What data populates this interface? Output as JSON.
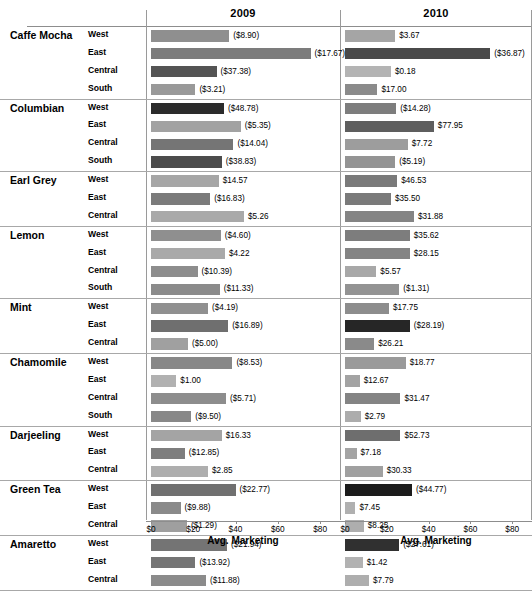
{
  "header": {
    "columns": [
      "2009",
      "2010"
    ]
  },
  "axis": {
    "title": "Avg. Marketing",
    "ticks": [
      "$0",
      "$20",
      "$40",
      "$60",
      "$80"
    ],
    "tick_values": [
      0,
      20,
      40,
      60,
      80
    ],
    "min": 0,
    "max": 88
  },
  "columns": {
    "category_header": "",
    "region_header": ""
  },
  "chart_data": {
    "type": "bar",
    "title": "",
    "subtitle": "",
    "xlabel": "Avg. Marketing",
    "ylabel": "",
    "xlim": [
      0,
      88
    ],
    "grid": false,
    "legend": "none",
    "orientation": "horizontal",
    "panel_columns": [
      "2009",
      "2010"
    ],
    "bar_length_measure": "Avg. Marketing",
    "bar_label_measure": "Profit",
    "note": "Bar length encodes Avg. Marketing; text label shows Profit (parentheses = negative). Bar darkness encodes profit magnitude.",
    "groups": [
      {
        "category": "Caffe Mocha",
        "rows": [
          {
            "region": "West",
            "y2009": {
              "marketing": 37.0,
              "label": "($8.90)",
              "shade": "#8f8f8f"
            },
            "y2010": {
              "marketing": 24.0,
              "label": "$3.67",
              "shade": "#a5a5a5"
            }
          },
          {
            "region": "East",
            "y2009": {
              "marketing": 75.5,
              "label": "($17.67)",
              "shade": "#7c7c7c"
            },
            "y2010": {
              "marketing": 69.5,
              "label": "($36.87)",
              "shade": "#4a4a4a"
            }
          },
          {
            "region": "Central",
            "y2009": {
              "marketing": 31.0,
              "label": "($37.38)",
              "shade": "#545454"
            },
            "y2010": {
              "marketing": 22.0,
              "label": "$0.18",
              "shade": "#b4b4b4"
            }
          },
          {
            "region": "South",
            "y2009": {
              "marketing": 21.0,
              "label": "($3.21)",
              "shade": "#999999"
            },
            "y2010": {
              "marketing": 15.5,
              "label": "$17.00",
              "shade": "#8b8b8b"
            }
          }
        ]
      },
      {
        "category": "Columbian",
        "rows": [
          {
            "region": "West",
            "y2009": {
              "marketing": 34.5,
              "label": "($48.78)",
              "shade": "#2b2b2b"
            },
            "y2010": {
              "marketing": 24.5,
              "label": "($14.28)",
              "shade": "#7d7d7d"
            }
          },
          {
            "region": "East",
            "y2009": {
              "marketing": 42.5,
              "label": "($5.35)",
              "shade": "#a2a2a2"
            },
            "y2010": {
              "marketing": 42.5,
              "label": "$77.95",
              "shade": "#5e5e5e"
            }
          },
          {
            "region": "Central",
            "y2009": {
              "marketing": 39.0,
              "label": "($14.04)",
              "shade": "#757575"
            },
            "y2010": {
              "marketing": 30.0,
              "label": "$7.72",
              "shade": "#9d9d9d"
            }
          },
          {
            "region": "South",
            "y2009": {
              "marketing": 33.5,
              "label": "($38.83)",
              "shade": "#4c4c4c"
            },
            "y2010": {
              "marketing": 24.0,
              "label": "($5.19)",
              "shade": "#949494"
            }
          }
        ]
      },
      {
        "category": "Earl Grey",
        "rows": [
          {
            "region": "West",
            "y2009": {
              "marketing": 32.0,
              "label": "$14.57",
              "shade": "#a6a6a6"
            },
            "y2010": {
              "marketing": 25.0,
              "label": "$46.53",
              "shade": "#7a7a7a"
            }
          },
          {
            "region": "East",
            "y2009": {
              "marketing": 28.0,
              "label": "($16.83)",
              "shade": "#7b7b7b"
            },
            "y2010": {
              "marketing": 22.0,
              "label": "$35.50",
              "shade": "#7a7a7a"
            }
          },
          {
            "region": "Central",
            "y2009": {
              "marketing": 44.0,
              "label": "$5.26",
              "shade": "#a9a9a9"
            },
            "y2010": {
              "marketing": 33.0,
              "label": "$31.88",
              "shade": "#848484"
            }
          }
        ]
      },
      {
        "category": "Lemon",
        "rows": [
          {
            "region": "West",
            "y2009": {
              "marketing": 33.0,
              "label": "($4.60)",
              "shade": "#8f8f8f"
            },
            "y2010": {
              "marketing": 31.0,
              "label": "$35.62",
              "shade": "#7d7d7d"
            }
          },
          {
            "region": "East",
            "y2009": {
              "marketing": 35.0,
              "label": "$4.22",
              "shade": "#a9a9a9"
            },
            "y2010": {
              "marketing": 31.0,
              "label": "$28.15",
              "shade": "#848484"
            }
          },
          {
            "region": "Central",
            "y2009": {
              "marketing": 22.0,
              "label": "($10.39)",
              "shade": "#8d8d8d"
            },
            "y2010": {
              "marketing": 15.0,
              "label": "$5.57",
              "shade": "#a8a8a8"
            }
          },
          {
            "region": "South",
            "y2009": {
              "marketing": 32.5,
              "label": "($11.33)",
              "shade": "#8b8b8b"
            },
            "y2010": {
              "marketing": 26.0,
              "label": "($1.31)",
              "shade": "#939393"
            }
          }
        ]
      },
      {
        "category": "Mint",
        "rows": [
          {
            "region": "West",
            "y2009": {
              "marketing": 27.0,
              "label": "($4.19)",
              "shade": "#909090"
            },
            "y2010": {
              "marketing": 21.0,
              "label": "$17.75",
              "shade": "#8d8d8d"
            }
          },
          {
            "region": "East",
            "y2009": {
              "marketing": 36.5,
              "label": "($16.89)",
              "shade": "#6f6f6f"
            },
            "y2010": {
              "marketing": 31.0,
              "label": "($28.19)",
              "shade": "#262626"
            }
          },
          {
            "region": "Central",
            "y2009": {
              "marketing": 17.5,
              "label": "($5.00)",
              "shade": "#a0a0a0"
            },
            "y2010": {
              "marketing": 14.0,
              "label": "$26.21",
              "shade": "#8a8a8a"
            }
          }
        ]
      },
      {
        "category": "Chamomile",
        "rows": [
          {
            "region": "West",
            "y2009": {
              "marketing": 38.5,
              "label": "($8.53)",
              "shade": "#888888"
            },
            "y2010": {
              "marketing": 29.0,
              "label": "$18.77",
              "shade": "#9a9a9a"
            }
          },
          {
            "region": "East",
            "y2009": {
              "marketing": 12.0,
              "label": "$1.00",
              "shade": "#b1b1b1"
            },
            "y2010": {
              "marketing": 7.0,
              "label": "$12.67",
              "shade": "#a3a3a3"
            }
          },
          {
            "region": "Central",
            "y2009": {
              "marketing": 35.5,
              "label": "($5.71)",
              "shade": "#8d8d8d"
            },
            "y2010": {
              "marketing": 26.5,
              "label": "$31.47",
              "shade": "#848484"
            }
          },
          {
            "region": "South",
            "y2009": {
              "marketing": 19.0,
              "label": "($9.50)",
              "shade": "#888888"
            },
            "y2010": {
              "marketing": 7.5,
              "label": "$2.79",
              "shade": "#acacac"
            }
          }
        ]
      },
      {
        "category": "Darjeeling",
        "rows": [
          {
            "region": "West",
            "y2009": {
              "marketing": 33.5,
              "label": "$16.33",
              "shade": "#a4a4a4"
            },
            "y2010": {
              "marketing": 26.5,
              "label": "$52.73",
              "shade": "#6e6e6e"
            }
          },
          {
            "region": "East",
            "y2009": {
              "marketing": 16.0,
              "label": "($12.85)",
              "shade": "#7e7e7e"
            },
            "y2010": {
              "marketing": 5.5,
              "label": "$7.18",
              "shade": "#a4a4a4"
            }
          },
          {
            "region": "Central",
            "y2009": {
              "marketing": 27.0,
              "label": "$2.85",
              "shade": "#aeaeae"
            },
            "y2010": {
              "marketing": 18.0,
              "label": "$30.33",
              "shade": "#a0a0a0"
            }
          }
        ]
      },
      {
        "category": "Green Tea",
        "rows": [
          {
            "region": "West",
            "y2009": {
              "marketing": 40.0,
              "label": "($22.77)",
              "shade": "#707070"
            },
            "y2010": {
              "marketing": 32.0,
              "label": "($44.77)",
              "shade": "#1c1c1c"
            }
          },
          {
            "region": "East",
            "y2009": {
              "marketing": 14.0,
              "label": "($9.88)",
              "shade": "#8a8a8a"
            },
            "y2010": {
              "marketing": 5.0,
              "label": "$7.45",
              "shade": "#b0b0b0"
            }
          },
          {
            "region": "Central",
            "y2009": {
              "marketing": 17.0,
              "label": "($1.29)",
              "shade": "#9f9f9f"
            },
            "y2010": {
              "marketing": 9.0,
              "label": "$8.25",
              "shade": "#aeaeae"
            }
          }
        ]
      },
      {
        "category": "Amaretto",
        "rows": [
          {
            "region": "West",
            "y2009": {
              "marketing": 36.0,
              "label": "($21.94)",
              "shade": "#747474"
            },
            "y2010": {
              "marketing": 26.0,
              "label": "($27.61)",
              "shade": "#303030"
            }
          },
          {
            "region": "East",
            "y2009": {
              "marketing": 21.0,
              "label": "($13.92)",
              "shade": "#757575"
            },
            "y2010": {
              "marketing": 8.5,
              "label": "$1.42",
              "shade": "#b2b2b2"
            }
          },
          {
            "region": "Central",
            "y2009": {
              "marketing": 26.0,
              "label": "($11.88)",
              "shade": "#8b8b8b"
            },
            "y2010": {
              "marketing": 11.5,
              "label": "$7.79",
              "shade": "#aeaeae"
            }
          }
        ]
      }
    ]
  }
}
